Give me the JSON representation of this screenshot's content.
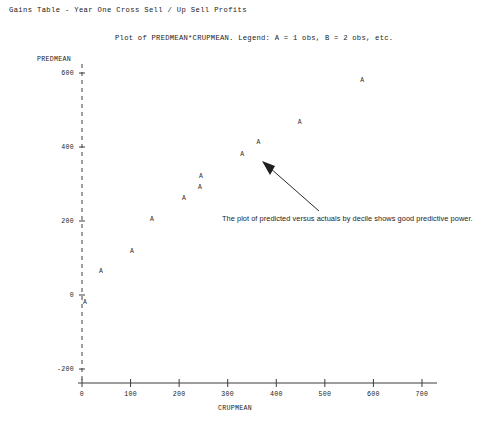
{
  "report": {
    "title": "Gains Table - Year One Cross Sell / Up Sell Profits",
    "subtitle": "Plot of PREDMEAN*CRUPMEAN.  Legend: A = 1 obs, B = 2 obs, etc."
  },
  "annotation": {
    "text": "The plot of predicted versus actuals by decile shows good predictive power.",
    "arrow": "arrow-pointing-up-left"
  },
  "chart_data": {
    "type": "scatter",
    "title": "Plot of PREDMEAN*CRUPMEAN.  Legend: A = 1 obs, B = 2 obs, etc.",
    "xlabel": "CRUPMEAN",
    "ylabel": "PREDMEAN",
    "xlim": [
      0,
      700
    ],
    "ylim": [
      -200,
      600
    ],
    "grid": false,
    "legend": "A = 1 obs, B = 2 obs, etc.",
    "marker_symbol": "A",
    "xticks": [
      "0",
      "100",
      "200",
      "300",
      "400",
      "500",
      "600",
      "700"
    ],
    "yticks": [
      "600",
      "400",
      "200",
      "0",
      "-200"
    ],
    "points": [
      {
        "x": 6,
        "y": -22
      },
      {
        "x": 39,
        "y": 62
      },
      {
        "x": 103,
        "y": 116
      },
      {
        "x": 144,
        "y": 203
      },
      {
        "x": 210,
        "y": 259
      },
      {
        "x": 243,
        "y": 289
      },
      {
        "x": 245,
        "y": 319
      },
      {
        "x": 330,
        "y": 378
      },
      {
        "x": 363,
        "y": 411
      },
      {
        "x": 448,
        "y": 465
      },
      {
        "x": 577,
        "y": 578
      }
    ]
  },
  "colors": {
    "background": "#ffffff",
    "ink": "#1a1a1a",
    "axis": "#3c3c3c",
    "marker": "#2a2a2a"
  }
}
